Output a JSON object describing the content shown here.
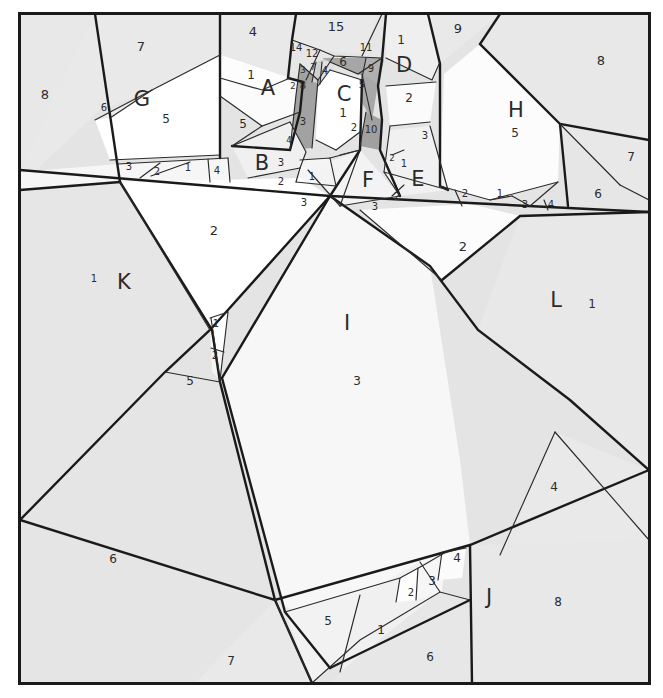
{
  "figure": {
    "frame": {
      "border_color": "#1a1a1a",
      "border_width": 3,
      "outer_background": "#ffffff",
      "x": 18,
      "y": 12,
      "width": 633,
      "height": 673
    },
    "palette": {
      "background_gray": "#e4e4e4",
      "light_gray": "#ebebeb",
      "pale_gray": "#f2f2f2",
      "near_white": "#f7f7f7",
      "white": "#ffffff",
      "mid_gray": "#a8a8a8",
      "dark_shade": "#9b9b9b",
      "stroke": "#1a1a1a",
      "thin_stroke": "#333333",
      "text": "#2b2b2b"
    }
  },
  "letter_labels": [
    {
      "id": "A",
      "text": "A",
      "x": 268,
      "y": 95
    },
    {
      "id": "B",
      "text": "B",
      "x": 262,
      "y": 170
    },
    {
      "id": "C",
      "text": "C",
      "x": 344,
      "y": 101
    },
    {
      "id": "D",
      "text": "D",
      "x": 404,
      "y": 72
    },
    {
      "id": "E",
      "text": "E",
      "x": 418,
      "y": 186
    },
    {
      "id": "F",
      "text": "F",
      "x": 368,
      "y": 187
    },
    {
      "id": "G",
      "text": "G",
      "x": 142,
      "y": 106
    },
    {
      "id": "H",
      "text": "H",
      "x": 516,
      "y": 117
    },
    {
      "id": "I",
      "text": "I",
      "x": 347,
      "y": 330
    },
    {
      "id": "J",
      "text": "J",
      "x": 489,
      "y": 604
    },
    {
      "id": "K",
      "text": "K",
      "x": 124,
      "y": 289
    },
    {
      "id": "L",
      "text": "L",
      "x": 556,
      "y": 307
    }
  ],
  "number_labels": [
    {
      "text": "7",
      "x": 141,
      "y": 51,
      "size": "lg"
    },
    {
      "text": "8",
      "x": 45,
      "y": 99,
      "size": "lg"
    },
    {
      "text": "6",
      "x": 104,
      "y": 111,
      "size": "sm"
    },
    {
      "text": "5",
      "x": 166,
      "y": 123,
      "size": "md"
    },
    {
      "text": "4",
      "x": 253,
      "y": 36,
      "size": "lg"
    },
    {
      "text": "1",
      "x": 251,
      "y": 79,
      "size": "md"
    },
    {
      "text": "5",
      "x": 243,
      "y": 128,
      "size": "md"
    },
    {
      "text": "3",
      "x": 129,
      "y": 170,
      "size": "sm"
    },
    {
      "text": "2",
      "x": 157,
      "y": 175,
      "size": "sm"
    },
    {
      "text": "1",
      "x": 188,
      "y": 171,
      "size": "sm"
    },
    {
      "text": "4",
      "x": 217,
      "y": 174,
      "size": "sm"
    },
    {
      "text": "3",
      "x": 281,
      "y": 166,
      "size": "sm"
    },
    {
      "text": "2",
      "x": 281,
      "y": 185,
      "size": "sm"
    },
    {
      "text": "1",
      "x": 312,
      "y": 180,
      "size": "sm"
    },
    {
      "text": "3",
      "x": 304,
      "y": 206,
      "size": "sm"
    },
    {
      "text": "2",
      "x": 214,
      "y": 235,
      "size": "lg"
    },
    {
      "text": "1",
      "x": 94,
      "y": 282,
      "size": "sm"
    },
    {
      "text": "15",
      "x": 336,
      "y": 31,
      "size": "lg"
    },
    {
      "text": "14",
      "x": 296,
      "y": 51,
      "size": "sm"
    },
    {
      "text": "12",
      "x": 312,
      "y": 57,
      "size": "sm"
    },
    {
      "text": "11",
      "x": 366,
      "y": 51,
      "size": "sm"
    },
    {
      "text": "6",
      "x": 343,
      "y": 66,
      "size": "md"
    },
    {
      "text": "9",
      "x": 371,
      "y": 72,
      "size": "sm"
    },
    {
      "text": "3",
      "x": 303,
      "y": 73,
      "size": "xs"
    },
    {
      "text": "7",
      "x": 313,
      "y": 70,
      "size": "xs"
    },
    {
      "text": "4",
      "x": 325,
      "y": 74,
      "size": "sm"
    },
    {
      "text": "8",
      "x": 303,
      "y": 89,
      "size": "sm"
    },
    {
      "text": "2",
      "x": 293,
      "y": 89,
      "size": "xs"
    },
    {
      "text": "5",
      "x": 362,
      "y": 88,
      "size": "sm"
    },
    {
      "text": "1",
      "x": 343,
      "y": 117,
      "size": "md"
    },
    {
      "text": "3",
      "x": 303,
      "y": 125,
      "size": "sm"
    },
    {
      "text": "4",
      "x": 289,
      "y": 143,
      "size": "xs"
    },
    {
      "text": "2",
      "x": 354,
      "y": 131,
      "size": "sm"
    },
    {
      "text": "10",
      "x": 371,
      "y": 133,
      "size": "sm"
    },
    {
      "text": "1",
      "x": 401,
      "y": 44,
      "size": "md"
    },
    {
      "text": "9",
      "x": 458,
      "y": 33,
      "size": "lg"
    },
    {
      "text": "8",
      "x": 601,
      "y": 65,
      "size": "lg"
    },
    {
      "text": "2",
      "x": 409,
      "y": 102,
      "size": "md"
    },
    {
      "text": "3",
      "x": 425,
      "y": 139,
      "size": "sm"
    },
    {
      "text": "2",
      "x": 392,
      "y": 161,
      "size": "xs"
    },
    {
      "text": "1",
      "x": 404,
      "y": 167,
      "size": "sm"
    },
    {
      "text": "5",
      "x": 515,
      "y": 137,
      "size": "md"
    },
    {
      "text": "7",
      "x": 631,
      "y": 161,
      "size": "md"
    },
    {
      "text": "6",
      "x": 598,
      "y": 198,
      "size": "md"
    },
    {
      "text": "2",
      "x": 465,
      "y": 197,
      "size": "sm"
    },
    {
      "text": "1",
      "x": 500,
      "y": 197,
      "size": "sm"
    },
    {
      "text": "3",
      "x": 525,
      "y": 208,
      "size": "sm"
    },
    {
      "text": "4",
      "x": 551,
      "y": 208,
      "size": "sm"
    },
    {
      "text": "2",
      "x": 397,
      "y": 200,
      "size": "sm"
    },
    {
      "text": "3",
      "x": 375,
      "y": 210,
      "size": "sm"
    },
    {
      "text": "2",
      "x": 463,
      "y": 251,
      "size": "lg"
    },
    {
      "text": "1",
      "x": 592,
      "y": 308,
      "size": "md"
    },
    {
      "text": "3",
      "x": 357,
      "y": 385,
      "size": "md"
    },
    {
      "text": "1",
      "x": 216,
      "y": 327,
      "size": "sm"
    },
    {
      "text": "2",
      "x": 215,
      "y": 359,
      "size": "sm"
    },
    {
      "text": "5",
      "x": 190,
      "y": 385,
      "size": "md"
    },
    {
      "text": "6",
      "x": 113,
      "y": 563,
      "size": "md"
    },
    {
      "text": "7",
      "x": 231,
      "y": 665,
      "size": "md"
    },
    {
      "text": "5",
      "x": 328,
      "y": 625,
      "size": "md"
    },
    {
      "text": "1",
      "x": 381,
      "y": 634,
      "size": "md"
    },
    {
      "text": "2",
      "x": 411,
      "y": 596,
      "size": "sm"
    },
    {
      "text": "3",
      "x": 432,
      "y": 585,
      "size": "md"
    },
    {
      "text": "4",
      "x": 457,
      "y": 562,
      "size": "md"
    },
    {
      "text": "6",
      "x": 430,
      "y": 661,
      "size": "md"
    },
    {
      "text": "8",
      "x": 558,
      "y": 606,
      "size": "md"
    },
    {
      "text": "4",
      "x": 554,
      "y": 491,
      "size": "md"
    }
  ],
  "regions": [
    {
      "id": "bg",
      "name": "background-field",
      "fill": "#e4e4e4"
    },
    {
      "id": "top-left-8",
      "name": "region-8-left",
      "fill": "#e8e8e8"
    },
    {
      "id": "top-7",
      "name": "region-7-top",
      "fill": "#e8e8e8"
    },
    {
      "id": "G",
      "name": "region-G",
      "fill": "#ffffff"
    },
    {
      "id": "A",
      "name": "region-A",
      "fill": "#fbfbfb"
    },
    {
      "id": "B",
      "name": "region-B",
      "fill": "#f0f0f0"
    },
    {
      "id": "C",
      "name": "region-C",
      "fill": "#ffffff"
    },
    {
      "id": "D",
      "name": "region-D",
      "fill": "#efefef"
    },
    {
      "id": "E",
      "name": "region-E",
      "fill": "#f1f1f1"
    },
    {
      "id": "F",
      "name": "region-F",
      "fill": "#f3f3f3"
    },
    {
      "id": "H",
      "name": "region-H",
      "fill": "#fcfcfc"
    },
    {
      "id": "I",
      "name": "region-I",
      "fill": "#f7f7f7"
    },
    {
      "id": "J",
      "name": "region-J",
      "fill": "#e8e8e8"
    },
    {
      "id": "K",
      "name": "region-K",
      "fill": "#e6e6e6"
    },
    {
      "id": "L",
      "name": "region-L",
      "fill": "#e8e8e8"
    },
    {
      "id": "shade-6",
      "name": "region-6-shaded",
      "fill": "#a6a6a6"
    },
    {
      "id": "shade-3",
      "name": "region-3-shaded",
      "fill": "#a0a0a0"
    },
    {
      "id": "shade-10",
      "name": "region-10-shaded",
      "fill": "#a0a0a0"
    }
  ]
}
